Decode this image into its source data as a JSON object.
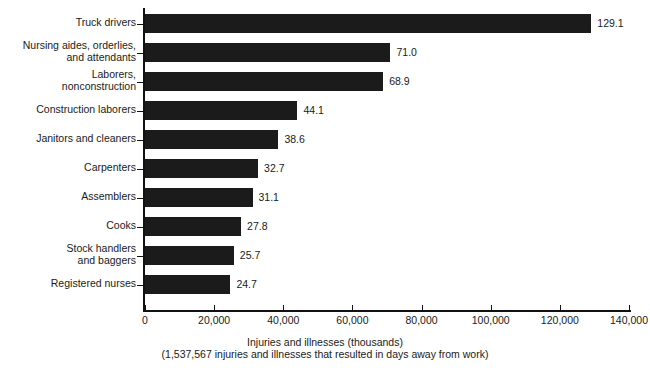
{
  "chart_data": {
    "type": "bar",
    "orientation": "horizontal",
    "title": "",
    "xlabel": "Injuries and illnesses (thousands)",
    "sublabel": "(1,537,567 injuries and illnesses that resulted in days away from work)",
    "ylabel": "",
    "xlim": [
      0,
      140000
    ],
    "grid": false,
    "legend": null,
    "bar_color": "#1b1b1b",
    "categories": [
      "Truck drivers",
      "Nursing aides, orderlies,\nand attendants",
      "Laborers,\nnonconstruction",
      "Construction laborers",
      "Janitors and cleaners",
      "Carpenters",
      "Assemblers",
      "Cooks",
      "Stock handlers\nand baggers",
      "Registered nurses"
    ],
    "values": [
      129.1,
      71.0,
      68.9,
      44.1,
      38.6,
      32.7,
      31.1,
      27.8,
      25.7,
      24.7
    ],
    "value_labels": [
      "129.1",
      "71.0",
      "68.9",
      "44.1",
      "38.6",
      "32.7",
      "31.1",
      "27.8",
      "25.7",
      "24.7"
    ],
    "value_units": "thousands",
    "xticks": [
      0,
      20000,
      40000,
      60000,
      80000,
      100000,
      120000,
      140000
    ],
    "xtick_labels": [
      "0",
      "20,000",
      "40,000",
      "60,000",
      "80,000",
      "100,000",
      "120,000",
      "140,000"
    ]
  }
}
